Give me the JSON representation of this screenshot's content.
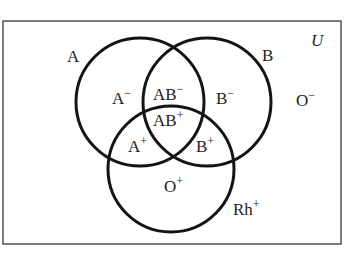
{
  "diagram": {
    "universe": {
      "label": "U",
      "rect": {
        "x": 3,
        "y": 21,
        "width": 338,
        "height": 223
      }
    },
    "sets": [
      {
        "id": "A",
        "label": "A",
        "cx": 140,
        "cy": 102,
        "r": 64,
        "label_pos": {
          "x": 67,
          "y": 62
        }
      },
      {
        "id": "B",
        "label": "B",
        "cx": 207,
        "cy": 102,
        "r": 64,
        "label_pos": {
          "x": 262,
          "y": 61
        }
      },
      {
        "id": "Rh",
        "label": "Rh",
        "sup": "+",
        "cx": 171,
        "cy": 169,
        "r": 63,
        "label_pos": {
          "x": 233,
          "y": 215
        }
      }
    ],
    "regions": [
      {
        "id": "A-neg",
        "base": "A",
        "sup": "−",
        "x": 112,
        "y": 104
      },
      {
        "id": "AB-neg",
        "base": "AB",
        "sup": "−",
        "x": 153,
        "y": 100
      },
      {
        "id": "B-neg",
        "base": "B",
        "sup": "−",
        "x": 216,
        "y": 104
      },
      {
        "id": "AB-pos",
        "base": "AB",
        "sup": "+",
        "x": 153,
        "y": 126
      },
      {
        "id": "A-pos",
        "base": "A",
        "sup": "+",
        "x": 128,
        "y": 152
      },
      {
        "id": "B-pos",
        "base": "B",
        "sup": "+",
        "x": 196,
        "y": 152
      },
      {
        "id": "O-pos",
        "base": "O",
        "sup": "+",
        "x": 164,
        "y": 192
      },
      {
        "id": "O-neg",
        "base": "O",
        "sup": "−",
        "x": 296,
        "y": 106
      }
    ],
    "colors": {
      "stroke": "#141414",
      "text": "#222222",
      "border": "#3a3a3a",
      "background": "#ffffff"
    }
  }
}
